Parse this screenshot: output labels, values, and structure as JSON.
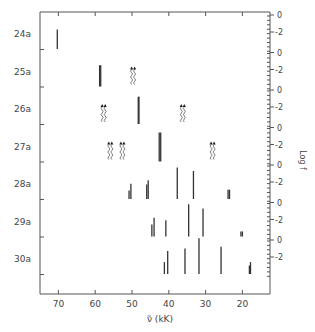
{
  "chart_data": {
    "type": "bar",
    "subtype": "stick-spectrum",
    "title": "",
    "xlabel": "ν̃ (kK)",
    "ylabel": "Log f",
    "xlim": [
      75,
      12.5
    ],
    "x_ticks": [
      70,
      60,
      50,
      40,
      30,
      20
    ],
    "log_f_ticks": [
      "0",
      "-2"
    ],
    "log_f_range": [
      -4,
      1
    ],
    "grid": false,
    "rows": [
      {
        "label": "24a",
        "lines": [
          {
            "x": 70.3,
            "logf": -1.7
          }
        ],
        "forbidden": []
      },
      {
        "label": "25a",
        "lines": [
          {
            "x": 58.8,
            "logf": -1.5
          },
          {
            "x": 58.5,
            "logf": -1.5
          }
        ],
        "forbidden": [
          49.7
        ]
      },
      {
        "label": "26a",
        "lines": [
          {
            "x": 48.3,
            "logf": -0.8
          },
          {
            "x": 48.1,
            "logf": -0.8
          }
        ],
        "forbidden": [
          57.7,
          36.2
        ]
      },
      {
        "label": "27a",
        "lines": [
          {
            "x": 42.6,
            "logf": -0.6
          },
          {
            "x": 42.2,
            "logf": -0.6
          }
        ],
        "forbidden": [
          55.9,
          52.6,
          28.1
        ]
      },
      {
        "label": "28a",
        "lines": [
          {
            "x": 50.8,
            "logf": -3.0
          },
          {
            "x": 50.3,
            "logf": -2.2
          },
          {
            "x": 46.0,
            "logf": -2.3
          },
          {
            "x": 45.6,
            "logf": -1.8
          },
          {
            "x": 37.7,
            "logf": -0.3
          },
          {
            "x": 33.3,
            "logf": -0.7
          },
          {
            "x": 23.9,
            "logf": -2.9
          },
          {
            "x": 23.5,
            "logf": -2.9
          }
        ],
        "forbidden": []
      },
      {
        "label": "29a",
        "lines": [
          {
            "x": 44.6,
            "logf": -2.6
          },
          {
            "x": 44.0,
            "logf": -1.8
          },
          {
            "x": 40.8,
            "logf": -2.1
          },
          {
            "x": 34.6,
            "logf": -0.2
          },
          {
            "x": 30.7,
            "logf": -0.7
          },
          {
            "x": 20.4,
            "logf": -3.4
          },
          {
            "x": 20.0,
            "logf": -3.4
          }
        ],
        "forbidden": []
      },
      {
        "label": "30a",
        "lines": [
          {
            "x": 41.2,
            "logf": -2.6
          },
          {
            "x": 40.3,
            "logf": -1.3
          },
          {
            "x": 35.6,
            "logf": -1.0
          },
          {
            "x": 31.8,
            "logf": 0.2
          },
          {
            "x": 25.8,
            "logf": -0.8
          },
          {
            "x": 18.1,
            "logf": -3.0
          },
          {
            "x": 17.8,
            "logf": -2.6
          }
        ],
        "forbidden": []
      }
    ]
  }
}
